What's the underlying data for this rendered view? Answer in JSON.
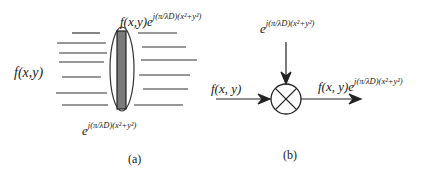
{
  "diagram_a": {
    "input_label": "f(x,y)",
    "output_label_base": "f(x,y)e",
    "output_exponent": "j(π/λD)(x²+y²)",
    "lens_label_base": "e",
    "lens_exponent": "j(π/λD)(x²+y²)",
    "caption": "(a)"
  },
  "diagram_b": {
    "input_label": "f(x, y)",
    "multiplier_label_base": "e",
    "multiplier_exponent": "j(π/λD)(x²+y²)",
    "output_label_base": "f(x, y)e",
    "output_exponent": "j(π/λD)(x²+y²)",
    "node": "multiplier",
    "caption": "(b)"
  }
}
